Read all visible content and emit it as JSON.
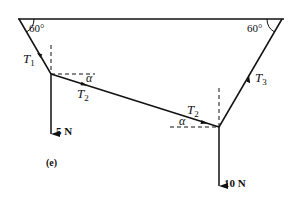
{
  "figure": {
    "label": "(e)",
    "ceiling": {
      "left_angle": "60°",
      "right_angle": "60°"
    },
    "tensions": {
      "t1": {
        "symbol": "T",
        "sub": "1"
      },
      "t2_left": {
        "symbol": "T",
        "sub": "2"
      },
      "t2_right": {
        "symbol": "T",
        "sub": "2"
      },
      "t3": {
        "symbol": "T",
        "sub": "3"
      }
    },
    "angles": {
      "alpha_left": "α",
      "alpha_right": "α"
    },
    "loads": {
      "left": "5 N",
      "right": "10 N"
    },
    "colors": {
      "ink": "#111111",
      "background": "#ffffff"
    }
  }
}
